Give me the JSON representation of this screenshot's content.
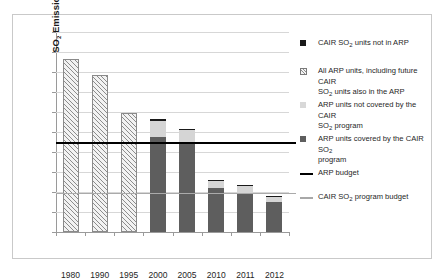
{
  "chart_data": {
    "type": "bar",
    "title": "",
    "xlabel": "",
    "ylabel": "SO2 Emissions (million tons)",
    "ylabel_parts": {
      "lead": "SO",
      "sub": "2",
      "tail": " Emissions (million tons)"
    },
    "categories": [
      "1980",
      "1990",
      "1995",
      "2000",
      "2005",
      "2010",
      "2011",
      "2012"
    ],
    "ylim": [
      0.0,
      20.0
    ],
    "ytick_step": 2.0,
    "yticks": [
      "0.0",
      "2.0",
      "4.0",
      "6.0",
      "8.0",
      "10.0",
      "12.0",
      "14.0",
      "16.0",
      "18.0",
      "20.0"
    ],
    "grid": true,
    "legend_position": "right",
    "stacked": true,
    "series": [
      {
        "name": "All ARP units, including future CAIR SO2 units also in the ARP",
        "key": "all_arp_hatched",
        "style": "hatch",
        "values": [
          17.3,
          15.7,
          11.9,
          null,
          null,
          null,
          null,
          null
        ]
      },
      {
        "name": "ARP units covered by the CAIR SO2 program",
        "key": "arp_covered_by_cair",
        "style": "dark",
        "values": [
          null,
          null,
          null,
          9.5,
          8.8,
          4.4,
          3.9,
          3.0
        ]
      },
      {
        "name": "ARP units not covered by the CAIR SO2 program",
        "key": "arp_not_covered_by_cair",
        "style": "light",
        "values": [
          null,
          null,
          null,
          1.65,
          1.45,
          0.7,
          0.7,
          0.55
        ]
      },
      {
        "name": "CAIR SO2 units not in ARP",
        "key": "cair_not_in_arp",
        "style": "black",
        "values": [
          null,
          null,
          null,
          0.2,
          0.1,
          0.15,
          0.1,
          0.1
        ]
      }
    ],
    "totals": [
      17.3,
      15.7,
      11.9,
      11.35,
      10.35,
      5.25,
      4.7,
      3.65
    ],
    "reference_lines": [
      {
        "name": "ARP budget",
        "value": 8.95,
        "style": "thick-black"
      },
      {
        "name": "CAIR SO2 program budget",
        "value": 3.9,
        "style": "thin-gray"
      }
    ]
  },
  "legend": {
    "items": [
      {
        "marker": "black-square",
        "lines": [
          {
            "lead": "CAIR SO",
            "sub": "2",
            "tail": " units not in ARP"
          }
        ]
      },
      {
        "marker": "hatched-square",
        "lines": [
          {
            "lead": "All ARP units, including future CAIR",
            "sub": "",
            "tail": ""
          },
          {
            "lead": "SO",
            "sub": "2",
            "tail": " units also in the ARP"
          }
        ]
      },
      {
        "marker": "light-gray-square",
        "lines": [
          {
            "lead": "ARP units not covered by the CAIR",
            "sub": "",
            "tail": ""
          },
          {
            "lead": "SO",
            "sub": "2",
            "tail": " program"
          }
        ]
      },
      {
        "marker": "dark-gray-square",
        "lines": [
          {
            "lead": "ARP units covered by the CAIR SO",
            "sub": "2",
            "tail": ""
          },
          {
            "lead": "program",
            "sub": "",
            "tail": ""
          }
        ]
      },
      {
        "marker": "black-line",
        "lines": [
          {
            "lead": "ARP budget",
            "sub": "",
            "tail": ""
          }
        ]
      },
      {
        "marker": "gray-line",
        "lines": [
          {
            "lead": "CAIR SO",
            "sub": "2",
            "tail": " program budget"
          }
        ]
      }
    ]
  },
  "colors": {
    "hatch_fill": "#f2f2f2",
    "hatch_stroke": "#8c8c8c",
    "dark_segment": "#5e5e5e",
    "light_segment": "#d5d5d5",
    "black_segment": "#1a1a1a",
    "arp_budget_line": "#000000",
    "cair_budget_line": "#aaaaaa",
    "gridline": "#d7d7d7",
    "axis": "#9a9a9a",
    "frame": "#c9c9c9",
    "background": "#ffffff"
  }
}
